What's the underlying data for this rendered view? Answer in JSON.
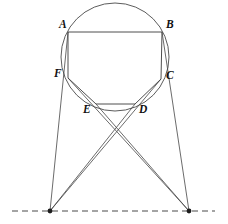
{
  "figure": {
    "canvas": {
      "width": 228,
      "height": 224,
      "background": "#ffffff"
    },
    "stroke_color": "#3a3a3a",
    "label_color": "#111111",
    "circle": {
      "cx": 115,
      "cy": 57,
      "r": 54,
      "stroke": "#4a4a4a"
    },
    "vertices": [
      {
        "name": "A",
        "label": "A",
        "x": 68,
        "y": 32,
        "label_x": 59,
        "label_y": 19
      },
      {
        "name": "B",
        "label": "B",
        "x": 162,
        "y": 32,
        "label_x": 166,
        "label_y": 19
      },
      {
        "name": "C",
        "label": "C",
        "x": 161,
        "y": 79,
        "label_x": 166,
        "label_y": 70
      },
      {
        "name": "D",
        "label": "D",
        "x": 135,
        "y": 104,
        "label_x": 139,
        "label_y": 104
      },
      {
        "name": "E",
        "label": "E",
        "x": 96,
        "y": 104,
        "label_x": 83,
        "label_y": 104
      },
      {
        "name": "F",
        "label": "F",
        "x": 68,
        "y": 78,
        "label_x": 54,
        "label_y": 68
      }
    ],
    "meet_points": [
      {
        "name": "left-meet-point",
        "x": 50,
        "y": 211
      },
      {
        "name": "right-meet-point",
        "x": 189,
        "y": 211
      }
    ],
    "axis_line": {
      "y": 211,
      "x_start": 12,
      "x_end": 215,
      "style": "dashed"
    },
    "hexagon_path": "M 68 32 L 162 32 L 161 79 L 135 104 L 96 104 L 68 78 Z",
    "extension_segments": [
      {
        "name": "segment-A-to-left-meet",
        "x1": 68,
        "y1": 32,
        "x2": 50,
        "y2": 211
      },
      {
        "name": "segment-B-to-right-meet",
        "x1": 162,
        "y1": 32,
        "x2": 189,
        "y2": 211
      },
      {
        "name": "segment-F-to-right-meet",
        "x1": 68,
        "y1": 78,
        "x2": 189,
        "y2": 211
      },
      {
        "name": "segment-C-to-left-meet",
        "x1": 161,
        "y1": 79,
        "x2": 50,
        "y2": 211
      },
      {
        "name": "segment-E-to-right-meet",
        "x1": 96,
        "y1": 104,
        "x2": 189,
        "y2": 211
      },
      {
        "name": "segment-D-to-left-meet",
        "x1": 135,
        "y1": 104,
        "x2": 50,
        "y2": 211
      }
    ]
  }
}
